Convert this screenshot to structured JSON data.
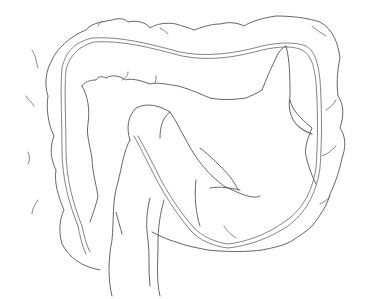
{
  "diagram": {
    "stroke_color": "#555555",
    "background": "#ffffff",
    "parts": [
      "ascending-colon",
      "transverse-colon",
      "descending-colon",
      "sigmoid-colon",
      "rectum"
    ]
  }
}
